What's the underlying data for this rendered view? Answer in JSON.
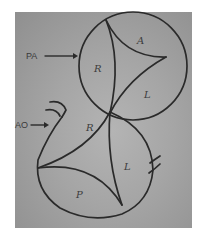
{
  "figure": {
    "type": "hand-drawn anatomical sketch",
    "background_color": "#a5a5a5",
    "ink_color": "#2a2a2a"
  },
  "labels": {
    "pa": "PA",
    "ao": "AO"
  },
  "pulmonary_valve": {
    "name": "PA",
    "cusps": [
      {
        "id": "r",
        "label": "R"
      },
      {
        "id": "a",
        "label": "A"
      },
      {
        "id": "l",
        "label": "L"
      }
    ]
  },
  "aortic_valve": {
    "name": "AO",
    "cusps": [
      {
        "id": "r",
        "label": "R"
      },
      {
        "id": "l",
        "label": "L"
      },
      {
        "id": "p",
        "label": "P"
      }
    ]
  }
}
